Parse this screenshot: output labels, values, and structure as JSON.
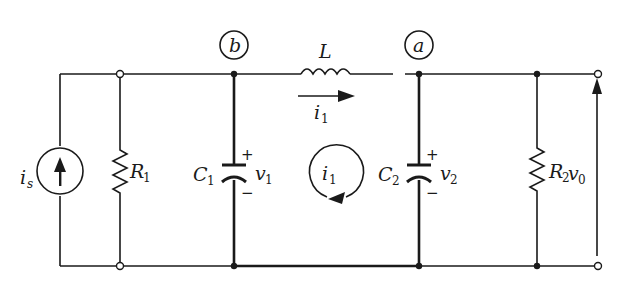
{
  "diagram": {
    "type": "circuit-schematic",
    "nodes": {
      "b": {
        "label": "b"
      },
      "a": {
        "label": "a"
      }
    },
    "source": {
      "symbol": "i",
      "sub": "s",
      "kind": "current-source",
      "direction": "up"
    },
    "components": {
      "R1": {
        "symbol": "R",
        "sub": "1"
      },
      "C1": {
        "symbol": "C",
        "sub": "1"
      },
      "L": {
        "symbol": "L"
      },
      "C2": {
        "symbol": "C",
        "sub": "2"
      },
      "R2": {
        "symbol": "R",
        "sub": "2"
      }
    },
    "voltages": {
      "v1": {
        "symbol": "v",
        "sub": "1",
        "plus": "+",
        "minus": "−"
      },
      "v2": {
        "symbol": "v",
        "sub": "2",
        "plus": "+",
        "minus": "−"
      },
      "v0": {
        "symbol": "v",
        "sub": "0"
      }
    },
    "currents": {
      "branch_i1": {
        "symbol": "i",
        "sub": "1",
        "direction": "right"
      },
      "loop_i1": {
        "symbol": "i",
        "sub": "1",
        "direction": "clockwise"
      }
    },
    "colors": {
      "ink": "#1a1a1a",
      "background": "#ffffff"
    }
  }
}
